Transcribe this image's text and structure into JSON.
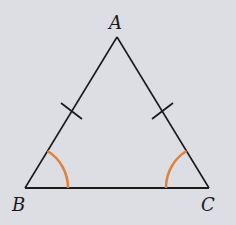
{
  "figure": {
    "type": "isosceles-triangle",
    "background_color": "#dddde4",
    "line_color": "#1a1a1a",
    "angle_mark_color": "#e0823c",
    "vertices": {
      "A": {
        "label": "A",
        "x": 117,
        "y": 37
      },
      "B": {
        "label": "B",
        "x": 25,
        "y": 188
      },
      "C": {
        "label": "C",
        "x": 209,
        "y": 188
      }
    },
    "equal_side_ticks": [
      "AB",
      "AC"
    ],
    "equal_angle_marks": [
      "B",
      "C"
    ]
  },
  "labels": {
    "A": "A",
    "B": "B",
    "C": "C"
  }
}
